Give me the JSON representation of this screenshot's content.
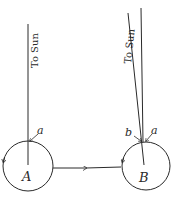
{
  "diagram": {
    "left": {
      "ray_label": "To Sun",
      "point_label": "a",
      "body_label": "A"
    },
    "right": {
      "ray_label": "To Sun",
      "point_label_a": "a",
      "point_label_b": "b",
      "body_label": "B"
    },
    "colors": {
      "ink": "#2a2a2a",
      "background": "#ffffff"
    }
  }
}
